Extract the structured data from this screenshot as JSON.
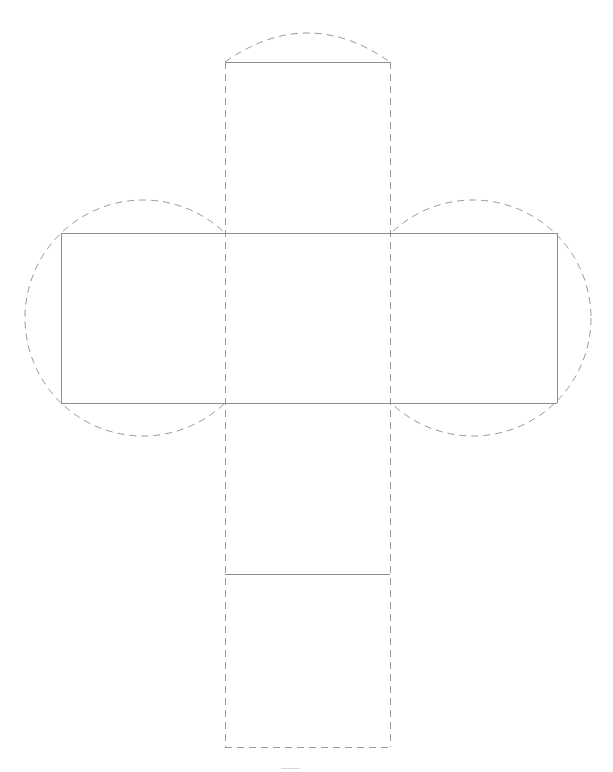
{
  "document": {
    "kind": "geometric-net-diagram",
    "title": "Cube net with circumscribed circles",
    "background_color": "#ffffff",
    "width": 613,
    "height": 772
  },
  "style": {
    "solid_stroke_color": "#8d8d8d",
    "fold_stroke_color": "#9a9a9a",
    "circle_stroke_color": "#9a9a9a",
    "faint_mark_color": "#d8d8d8",
    "stroke_width": 1,
    "fold_dash_pattern": "7 5"
  },
  "geometry": {
    "band": {
      "left": 61,
      "right": 557,
      "top": 233,
      "bottom": 403
    },
    "column": {
      "left": 225,
      "right": 390,
      "top": 62,
      "bottom": 747
    },
    "faces": [
      {
        "name": "left-square",
        "x": 61,
        "y": 233,
        "width": 164,
        "height": 170
      },
      {
        "name": "center-square",
        "x": 225,
        "y": 233,
        "width": 165,
        "height": 170
      },
      {
        "name": "right-square",
        "x": 390,
        "y": 233,
        "width": 167,
        "height": 170
      },
      {
        "name": "top-square",
        "x": 225,
        "y": 62,
        "width": 165,
        "height": 171
      },
      {
        "name": "bottom-square",
        "x": 225,
        "y": 403,
        "width": 165,
        "height": 171
      },
      {
        "name": "bottom-tab",
        "x": 225,
        "y": 574,
        "width": 165,
        "height": 173
      }
    ],
    "circles": [
      {
        "name": "left-circumcircle",
        "cx": 143,
        "cy": 318,
        "r": 118
      },
      {
        "name": "right-circumcircle",
        "cx": 473,
        "cy": 318,
        "r": 118
      }
    ],
    "top_cap_arc": {
      "name": "top-cap-arc",
      "start_x": 225,
      "start_y": 62,
      "end_x": 390,
      "end_y": 62,
      "apex_y": 33
    },
    "faint_mark": {
      "x1": 281,
      "y1": 768,
      "x2": 300,
      "y2": 768
    }
  },
  "edges": {
    "solid": [
      {
        "name": "band-top-edge",
        "x1": 61,
        "y1": 233,
        "x2": 557,
        "y2": 233
      },
      {
        "name": "band-bottom-edge",
        "x1": 61,
        "y1": 403,
        "x2": 557,
        "y2": 403
      },
      {
        "name": "band-left-edge",
        "x1": 61,
        "y1": 233,
        "x2": 61,
        "y2": 403
      },
      {
        "name": "band-right-edge",
        "x1": 557,
        "y1": 233,
        "x2": 557,
        "y2": 403
      },
      {
        "name": "top-tab-top-edge",
        "x1": 225,
        "y1": 62,
        "x2": 390,
        "y2": 62
      },
      {
        "name": "bottom-tab-divider",
        "x1": 225,
        "y1": 574,
        "x2": 390,
        "y2": 574
      }
    ],
    "fold": [
      {
        "name": "fold-left-vertical",
        "x1": 225,
        "y1": 62,
        "x2": 225,
        "y2": 747
      },
      {
        "name": "fold-right-vertical",
        "x1": 390,
        "y1": 62,
        "x2": 390,
        "y2": 747
      },
      {
        "name": "bottom-tab-edge",
        "x1": 225,
        "y1": 747,
        "x2": 390,
        "y2": 747
      }
    ]
  },
  "labels": {
    "none_visible": ""
  }
}
